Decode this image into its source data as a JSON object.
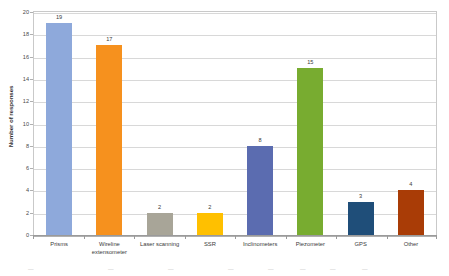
{
  "chart_data": {
    "type": "bar",
    "title": "",
    "xlabel": "",
    "ylabel": "Number of responses",
    "ylim": [
      0,
      20
    ],
    "ytick_step": 2,
    "grid": true,
    "legend": "none",
    "categories": [
      "Prisms",
      "Wireline extensometer",
      "Laser scanning",
      "SSR",
      "Inclinometers",
      "Piezometer",
      "GPS",
      "Other"
    ],
    "values": [
      19,
      17,
      2,
      2,
      8,
      15,
      3,
      4
    ],
    "bar_colors": [
      "#8EA9DB",
      "#F6911E",
      "#A8A598",
      "#FFC000",
      "#5B6CB0",
      "#78AC30",
      "#1F4E79",
      "#A93C06"
    ],
    "ytick_labels": [
      "0",
      "2",
      "4",
      "6",
      "8",
      "10",
      "12",
      "14",
      "16",
      "18",
      "20"
    ],
    "data_labels": [
      "19",
      "17",
      "2",
      "2",
      "8",
      "15",
      "3",
      "4"
    ],
    "category_lines": [
      [
        "Prisms"
      ],
      [
        "Wireline",
        "extensometer"
      ],
      [
        "Laser scanning"
      ],
      [
        "SSR"
      ],
      [
        "Inclinometers"
      ],
      [
        "Piezometer"
      ],
      [
        "GPS"
      ],
      [
        "Other"
      ]
    ]
  },
  "axes": {
    "y_title": "Number of responses"
  },
  "colors": {
    "grid": "#d8d8d8",
    "frame": "#c9c9c9",
    "axis": "#9a9a9a",
    "text": "#3a3a3a"
  }
}
